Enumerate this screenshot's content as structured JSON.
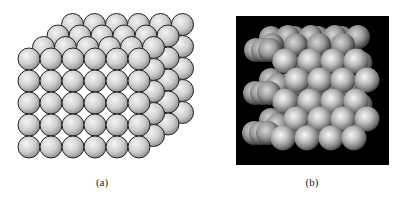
{
  "figure": {
    "panels": [
      {
        "id": "a",
        "caption": "(a)",
        "description": "Hard-sphere model of a simple cubic crystal lattice, line-drawn spheres",
        "lattice": {
          "front_columns": 6,
          "front_rows": 5,
          "depth_layers": 4,
          "origin_x": 29,
          "origin_y": 59,
          "spacing": 22,
          "radius": 11,
          "layer_offset_x": 14.5,
          "layer_offset_y": -11.5
        },
        "colors": {
          "sphere_light": "#f2f2f2",
          "sphere_dark": "#8c8c8c",
          "outline": "#222222",
          "background": "#ffffff"
        }
      },
      {
        "id": "b",
        "caption": "(b)",
        "description": "Rendered 3D close-packed sphere crystal on black background",
        "box": {
          "x": 36,
          "y": 16,
          "width": 153,
          "height": 149
        },
        "colors": {
          "background": "#000000",
          "sphere_light": "#f4f4f4",
          "sphere_mid": "#b8b8b8",
          "sphere_dark": "#4a4a4a"
        }
      }
    ]
  }
}
